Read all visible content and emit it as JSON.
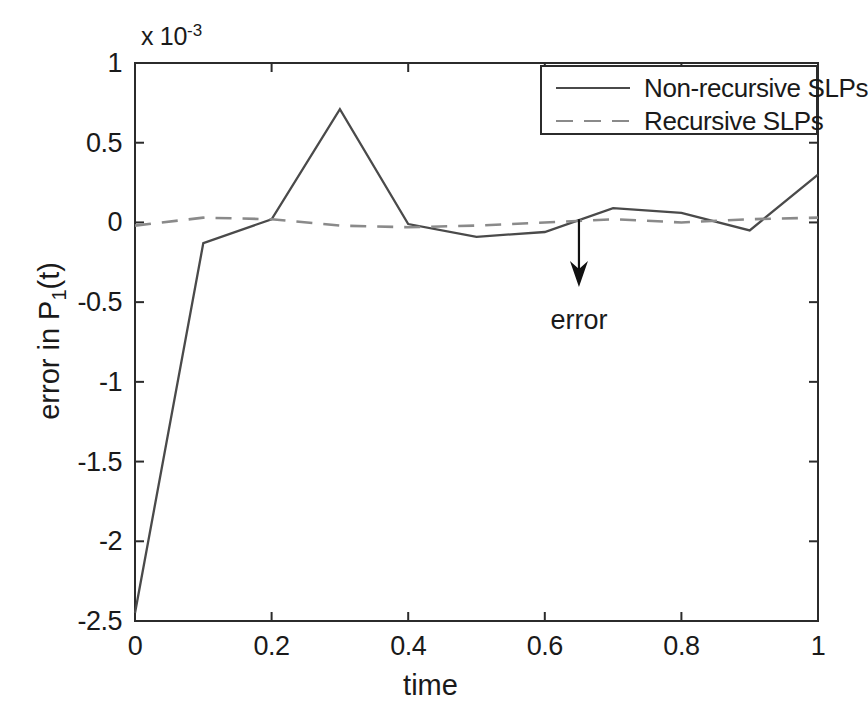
{
  "chart_data": {
    "type": "line",
    "title": "",
    "xlabel": "time",
    "ylabel": "error in P_1(t)",
    "ylabel_base": "error in P",
    "ylabel_sub": "1",
    "ylabel_tail": "(t)",
    "y_exponent_label": "x 10",
    "y_exponent_power": "-3",
    "y_scale_factor": 0.001,
    "xlim": [
      0,
      1
    ],
    "ylim": [
      -2.5,
      1
    ],
    "xticks": [
      0,
      0.2,
      0.4,
      0.6,
      0.8,
      1
    ],
    "xtick_labels": [
      "0",
      "0.2",
      "0.4",
      "0.6",
      "0.8",
      "1"
    ],
    "yticks": [
      1,
      0.5,
      0,
      -0.5,
      -1,
      -1.5,
      -2,
      -2.5
    ],
    "ytick_labels": [
      "1",
      "0.5",
      "0",
      "-0.5",
      "-1",
      "-1.5",
      "-2",
      "-2.5"
    ],
    "grid": false,
    "legend_position": "top-right",
    "x": [
      0,
      0.1,
      0.2,
      0.3,
      0.4,
      0.5,
      0.6,
      0.7,
      0.8,
      0.9,
      1.0
    ],
    "series": [
      {
        "name": "Non-recursive SLPs",
        "style": "solid",
        "color": "#4a4a4a",
        "values": [
          -2.45,
          -0.13,
          0.02,
          0.71,
          -0.01,
          -0.09,
          -0.06,
          0.09,
          0.06,
          -0.05,
          0.3
        ]
      },
      {
        "name": "Recursive SLPs",
        "style": "dashed",
        "color": "#8a8a8a",
        "values": [
          -0.02,
          0.03,
          0.02,
          -0.02,
          -0.03,
          -0.02,
          0.0,
          0.02,
          0.0,
          0.02,
          0.03
        ]
      }
    ],
    "annotations": [
      {
        "text": "error",
        "type": "arrow",
        "x": 0.65,
        "arrow_from_y": 0.02,
        "arrow_to_y": -0.38,
        "text_y": -0.62
      }
    ]
  },
  "legend": {
    "entries": [
      {
        "label": "Non-recursive SLPs",
        "style": "solid"
      },
      {
        "label": "Recursive SLPs",
        "style": "dashed"
      }
    ]
  },
  "colors": {
    "background": "#ffffff",
    "axis": "#2b2b2b",
    "solid_series": "#4a4a4a",
    "dashed_series": "#8a8a8a",
    "text": "#1a1a1a"
  }
}
